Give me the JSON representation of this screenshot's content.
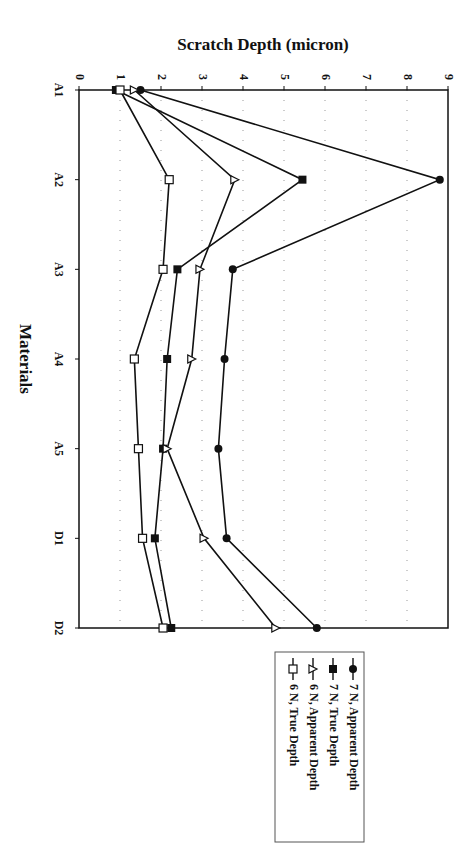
{
  "chart_data": {
    "type": "line",
    "orientation": "rotated 90 degrees clockwise (categories run top-to-bottom, value axis runs left-to-right)",
    "title": "Scratch Depth (micron)",
    "xlabel": "Materials",
    "ylabel": "Scratch Depth (micron)",
    "categories": [
      "A1",
      "A2",
      "A3",
      "A4",
      "A5",
      "D1",
      "D2"
    ],
    "ylim": [
      0,
      9
    ],
    "yticks": [
      "0",
      "1",
      "2",
      "3",
      "4",
      "5",
      "6",
      "7",
      "8",
      "9"
    ],
    "grid": "dotted lines at each integer value",
    "legend_position": "bottom (rotated, below plot)",
    "series": [
      {
        "name": "7 N, Apparent Depth",
        "marker": "filled-circle",
        "values": [
          1.5,
          8.8,
          3.75,
          3.55,
          3.4,
          3.6,
          5.8
        ]
      },
      {
        "name": "7 N, True Depth",
        "marker": "filled-square",
        "values": [
          0.9,
          5.45,
          2.4,
          2.15,
          2.05,
          1.85,
          2.25
        ]
      },
      {
        "name": "6 N, Apparent Depth",
        "marker": "open-triangle",
        "values": [
          1.35,
          3.8,
          2.95,
          2.75,
          2.15,
          3.05,
          4.8
        ]
      },
      {
        "name": "6 N, True Depth",
        "marker": "open-square",
        "values": [
          1.0,
          2.2,
          2.05,
          1.35,
          1.45,
          1.55,
          2.05
        ]
      }
    ]
  }
}
